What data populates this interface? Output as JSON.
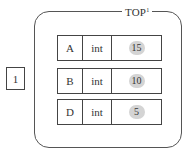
{
  "diagram": {
    "container": {
      "title": "TOP",
      "title_superscript": "1"
    },
    "side_node": {
      "label": "1"
    },
    "rows": [
      {
        "name": "A",
        "type": "int",
        "value": "15"
      },
      {
        "name": "B",
        "type": "int",
        "value": "10"
      },
      {
        "name": "D",
        "type": "int",
        "value": "5"
      }
    ]
  },
  "colors": {
    "border": "#444444",
    "value_badge": "#d4d4d4",
    "text": "#333333",
    "background": "#ffffff"
  }
}
